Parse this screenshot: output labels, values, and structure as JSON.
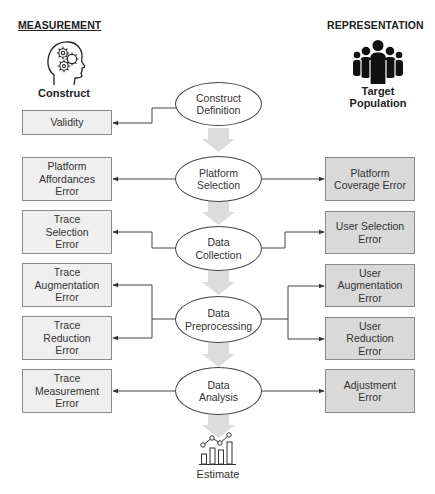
{
  "headers": {
    "measurement": "MEASUREMENT",
    "representation": "REPRESENTATION"
  },
  "measurement_icon": {
    "icon": "head-gears-icon",
    "label": "Construct"
  },
  "representation_icon": {
    "icon": "people-group-icon",
    "label": "Target\nPopulation"
  },
  "process": [
    {
      "label": "Construct\nDefinition"
    },
    {
      "label": "Platform\nSelection"
    },
    {
      "label": "Data\nCollection"
    },
    {
      "label": "Data\nPreprocessing"
    },
    {
      "label": "Data\nAnalysis"
    }
  ],
  "measurement_errors": [
    {
      "label": "Validity"
    },
    {
      "label": "Platform\nAffordances\nError"
    },
    {
      "label": "Trace\nSelection\nError"
    },
    {
      "label": "Trace\nAugmentation\nError"
    },
    {
      "label": "Trace\nReduction\nError"
    },
    {
      "label": "Trace\nMeasurement\nError"
    }
  ],
  "representation_errors": [
    {
      "label": "Platform\nCoverage Error"
    },
    {
      "label": "User Selection\nError"
    },
    {
      "label": "User\nAugmentation\nError"
    },
    {
      "label": "User\nReduction\nError"
    },
    {
      "label": "Adjustment\nError"
    }
  ],
  "output": {
    "icon": "chart-estimate-icon",
    "label": "Estimate"
  },
  "colors": {
    "measurement_box": "#efefef",
    "representation_box": "#d9d9d9",
    "flow_arrow": "#d8d8d8",
    "line": "#444444"
  }
}
